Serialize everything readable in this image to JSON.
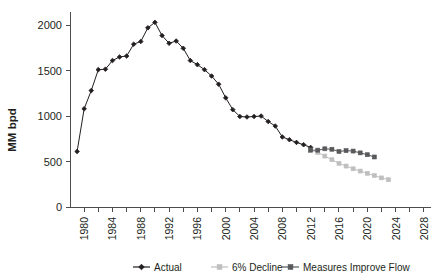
{
  "chart_data": {
    "type": "line",
    "title": "",
    "xlabel": "",
    "ylabel": "MM bpd",
    "xlim": [
      1978,
      2029
    ],
    "ylim": [
      0,
      2100
    ],
    "yticks": [
      0,
      500,
      1000,
      1500,
      2000
    ],
    "ytick_labels": [
      "0",
      "500",
      "1000",
      "1500",
      "2000"
    ],
    "xticks": [
      1980,
      1984,
      1988,
      1992,
      1996,
      2000,
      2004,
      2008,
      2012,
      2016,
      2020,
      2024,
      2028
    ],
    "xtick_labels": [
      "1980",
      "1984",
      "1988",
      "1992",
      "1996",
      "2000",
      "2004",
      "2008",
      "2012",
      "2016",
      "2020",
      "2024",
      "2028"
    ],
    "x_minor_tick_step": 2,
    "grid": false,
    "legend_position": "bottom",
    "series": [
      {
        "name": "Actual",
        "color": "#231f20",
        "marker": "diamond",
        "x": [
          1979,
          1980,
          1981,
          1982,
          1983,
          1984,
          1985,
          1986,
          1987,
          1988,
          1989,
          1990,
          1991,
          1992,
          1993,
          1994,
          1995,
          1996,
          1997,
          1998,
          1999,
          2000,
          2001,
          2002,
          2003,
          2004,
          2005,
          2006,
          2007,
          2008,
          2009,
          2010,
          2011,
          2012
        ],
        "values": [
          610,
          1080,
          1280,
          1510,
          1515,
          1610,
          1650,
          1660,
          1790,
          1820,
          1970,
          2030,
          1885,
          1800,
          1825,
          1745,
          1610,
          1565,
          1510,
          1440,
          1350,
          1200,
          1070,
          995,
          990,
          995,
          1000,
          940,
          890,
          770,
          740,
          710,
          685,
          655
        ]
      },
      {
        "name": "6% Decline",
        "color": "#bfbfbf",
        "marker": "square",
        "x": [
          2012,
          2013,
          2014,
          2015,
          2016,
          2017,
          2018,
          2019,
          2020,
          2021,
          2022,
          2023
        ],
        "values": [
          625,
          600,
          560,
          520,
          480,
          450,
          420,
          395,
          370,
          345,
          320,
          300
        ]
      },
      {
        "name": "Measures Improve Flow",
        "color": "#58595b",
        "marker": "square",
        "x": [
          2012,
          2013,
          2014,
          2015,
          2016,
          2017,
          2018,
          2019,
          2020,
          2021
        ],
        "values": [
          625,
          625,
          640,
          635,
          610,
          620,
          615,
          595,
          575,
          550
        ]
      }
    ]
  },
  "legend": {
    "items": [
      {
        "label": "Actual",
        "color": "#231f20",
        "marker": "diamond"
      },
      {
        "label": "6% Decline",
        "color": "#bfbfbf",
        "marker": "square"
      },
      {
        "label": "Measures Improve Flow",
        "color": "#58595b",
        "marker": "square"
      }
    ]
  }
}
